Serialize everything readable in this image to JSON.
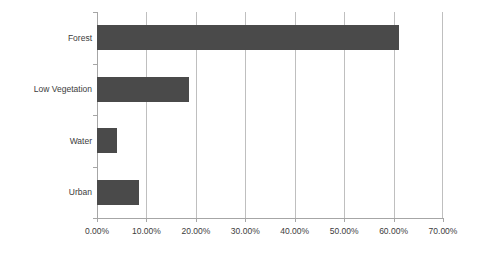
{
  "chart_data": {
    "type": "bar",
    "orientation": "horizontal",
    "title": "",
    "subtitle": "",
    "xlabel": "",
    "ylabel": "",
    "categories": [
      "Forest",
      "Low Vegetation",
      "Water",
      "Urban"
    ],
    "values": [
      61.0,
      18.6,
      4.0,
      8.4
    ],
    "value_labels": [
      "61.00%",
      "18.60%",
      "4.00%",
      "8.40%"
    ],
    "xlim": [
      0,
      70
    ],
    "xtick_values": [
      0,
      10,
      20,
      30,
      40,
      50,
      60,
      70
    ],
    "xtick_labels": [
      "0.00%",
      "10.00%",
      "20.00%",
      "30.00%",
      "40.00%",
      "50.00%",
      "60.00%",
      "70.00%"
    ],
    "grid": "vertical",
    "legend": "none",
    "series": [
      {
        "name": "Land Cover Proportion",
        "values": [
          61.0,
          18.6,
          4.0,
          8.4
        ]
      }
    ],
    "colors": {
      "bar": "#4a4a4a",
      "gridline": "#bfbfbf",
      "axis": "#a6a6a6",
      "text": "#3c3c3c",
      "background": "#ffffff"
    }
  }
}
